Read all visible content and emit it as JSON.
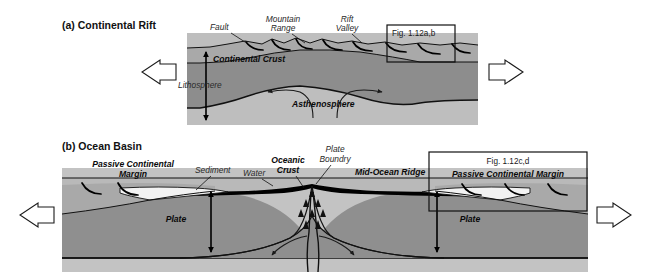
{
  "figure": {
    "background": "#ffffff",
    "width": 650,
    "height": 278
  },
  "colors": {
    "continental_crust": "#a9a9a9",
    "mantle_lithosphere": "#8d8d8d",
    "asthenosphere": "#bebebe",
    "ocean_water": "#b9b9b9",
    "oceanic_crust": "#000000",
    "sediment": "#f2f2f2",
    "plate_mantle": "#8f8f8f",
    "sub_asthenosphere": "#c3c3c3",
    "outline": "#111111",
    "text": "#0a0a0a"
  },
  "panel_a": {
    "title": "(a) Continental Rift",
    "labels": {
      "fault": "Fault",
      "mountain_range_line1": "Mountain",
      "mountain_range_line2": "Range",
      "rift_valley_line1": "Rift",
      "rift_valley_line2": "Valley",
      "continental_crust": "Continental Crust",
      "lithosphere": "Lithosphere",
      "asthenosphere": "Asthenosphere"
    },
    "inset": {
      "caption": "Fig. 1.12a,b"
    },
    "arrows": {
      "left": "extension-arrow-left",
      "right": "extension-arrow-right"
    }
  },
  "panel_b": {
    "title": "(b) Ocean Basin",
    "labels": {
      "passive_margin_line1": "Passive Continental",
      "passive_margin_line2": "Margin",
      "sediment": "Sediment",
      "water": "Water",
      "oceanic_crust_line1": "Oceanic",
      "oceanic_crust_line2": "Crust",
      "plate_boundary_line1": "Plate",
      "plate_boundary_line2": "Boundry",
      "mid_ocean_ridge": "Mid-Ocean Ridge",
      "plate_left": "Plate",
      "plate_right": "Plate"
    },
    "inset": {
      "caption": "Fig. 1.12c,d",
      "subcaption": "Passive Continental Margin"
    },
    "arrows": {
      "left": "spreading-arrow-left",
      "right": "spreading-arrow-right"
    }
  }
}
